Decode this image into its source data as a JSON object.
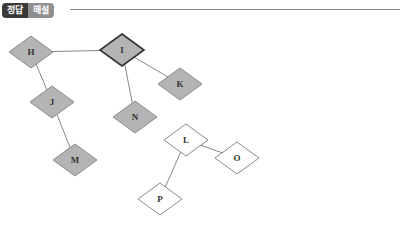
{
  "header": {
    "tabs": [
      {
        "label": "정답"
      },
      {
        "label": "해설"
      }
    ]
  },
  "diagram": {
    "colors": {
      "filled": "#b4b4b4",
      "empty": "#ffffff",
      "stroke": "#8a8a8a",
      "highlight_stroke": "#333333",
      "edge": "#888888"
    },
    "nodes": [
      {
        "id": "H",
        "label": "H",
        "x": 31,
        "y": 52,
        "filled": true,
        "highlight": false
      },
      {
        "id": "I",
        "label": "I",
        "x": 122,
        "y": 50,
        "filled": true,
        "highlight": true
      },
      {
        "id": "K",
        "label": "K",
        "x": 180,
        "y": 84,
        "filled": true,
        "highlight": false
      },
      {
        "id": "J",
        "label": "J",
        "x": 52,
        "y": 102,
        "filled": true,
        "highlight": false
      },
      {
        "id": "N",
        "label": "N",
        "x": 135,
        "y": 117,
        "filled": true,
        "highlight": false
      },
      {
        "id": "M",
        "label": "M",
        "x": 75,
        "y": 160,
        "filled": true,
        "highlight": false
      },
      {
        "id": "L",
        "label": "L",
        "x": 186,
        "y": 140,
        "filled": false,
        "highlight": false
      },
      {
        "id": "O",
        "label": "O",
        "x": 237,
        "y": 158,
        "filled": false,
        "highlight": false
      },
      {
        "id": "P",
        "label": "P",
        "x": 160,
        "y": 199,
        "filled": false,
        "highlight": false
      }
    ],
    "edges": [
      [
        "H",
        "I"
      ],
      [
        "I",
        "K"
      ],
      [
        "I",
        "N"
      ],
      [
        "H",
        "J"
      ],
      [
        "J",
        "M"
      ],
      [
        "L",
        "O"
      ],
      [
        "L",
        "P"
      ]
    ]
  }
}
